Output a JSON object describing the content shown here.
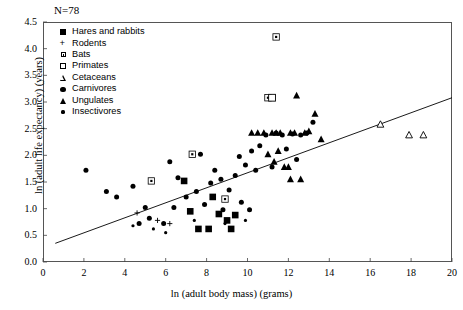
{
  "annotation": {
    "sample_size": "N=78"
  },
  "axes": {
    "xlabel": "ln (adult body mass) (grams)",
    "ylabel": "ln (adult life expectancy) (years)",
    "xticks": [
      "0",
      "2",
      "4",
      "6",
      "8",
      "10",
      "12",
      "14",
      "16",
      "18",
      "20"
    ],
    "yticks": [
      "0.0",
      "0.5",
      "1.0",
      "1.5",
      "2.0",
      "2.5",
      "3.0",
      "3.5",
      "4.0",
      "4.5"
    ]
  },
  "legend": {
    "entries": [
      {
        "label": "Hares and rabbits",
        "marker": "square-filled"
      },
      {
        "label": "Rodents",
        "marker": "plus"
      },
      {
        "label": "Bats",
        "marker": "square-dotted"
      },
      {
        "label": "Primates",
        "marker": "square-open"
      },
      {
        "label": "Cetaceans",
        "marker": "triangle-open"
      },
      {
        "label": "Carnivores",
        "marker": "circle-filled"
      },
      {
        "label": "Ungulates",
        "marker": "triangle-filled"
      },
      {
        "label": "Insectivores",
        "marker": "dot-small"
      }
    ]
  },
  "chart_data": {
    "type": "scatter",
    "title": "",
    "xlabel": "ln (adult body mass) (grams)",
    "ylabel": "ln (adult life expectancy) (years)",
    "xlim": [
      0,
      20
    ],
    "ylim": [
      0.0,
      4.5
    ],
    "xticks": [
      0,
      2,
      4,
      6,
      8,
      10,
      12,
      14,
      16,
      18,
      20
    ],
    "yticks": [
      0.0,
      0.5,
      1.0,
      1.5,
      2.0,
      2.5,
      3.0,
      3.5,
      4.0,
      4.5
    ],
    "grid": false,
    "legend_position": "upper-left-inside",
    "sample_size": 78,
    "regression_line": {
      "x0": 0.6,
      "y0": 0.35,
      "x1": 20.0,
      "y1": 3.08
    },
    "series": [
      {
        "name": "Hares and rabbits",
        "marker": "square-filled",
        "points": [
          [
            7.2,
            0.95
          ],
          [
            7.6,
            0.62
          ],
          [
            8.1,
            0.62
          ],
          [
            8.6,
            0.9
          ],
          [
            9.0,
            0.78
          ],
          [
            9.2,
            0.62
          ],
          [
            9.4,
            0.88
          ],
          [
            6.9,
            1.52
          ],
          [
            8.3,
            1.22
          ]
        ]
      },
      {
        "name": "Rodents",
        "marker": "plus",
        "points": [
          [
            4.6,
            0.92
          ],
          [
            5.6,
            0.78
          ],
          [
            6.2,
            0.72
          ]
        ]
      },
      {
        "name": "Bats",
        "marker": "square-dotted",
        "points": [
          [
            11.4,
            4.22
          ],
          [
            11.0,
            3.08
          ],
          [
            7.3,
            2.02
          ],
          [
            5.3,
            1.52
          ],
          [
            8.9,
            1.18
          ]
        ]
      },
      {
        "name": "Primates",
        "marker": "square-open",
        "points": [
          [
            11.2,
            3.08
          ]
        ]
      },
      {
        "name": "Cetaceans",
        "marker": "triangle-open",
        "points": [
          [
            16.5,
            2.58
          ],
          [
            17.9,
            2.38
          ],
          [
            18.6,
            2.38
          ]
        ]
      },
      {
        "name": "Carnivores",
        "marker": "circle-filled",
        "points": [
          [
            2.1,
            1.72
          ],
          [
            3.1,
            1.32
          ],
          [
            3.6,
            1.22
          ],
          [
            4.4,
            1.42
          ],
          [
            4.7,
            0.72
          ],
          [
            5.2,
            0.82
          ],
          [
            5.9,
            0.72
          ],
          [
            6.4,
            1.02
          ],
          [
            6.6,
            1.58
          ],
          [
            7.0,
            1.22
          ],
          [
            7.5,
            1.32
          ],
          [
            7.9,
            1.08
          ],
          [
            8.2,
            1.48
          ],
          [
            8.4,
            1.72
          ],
          [
            8.7,
            1.55
          ],
          [
            9.1,
            1.35
          ],
          [
            9.4,
            1.62
          ],
          [
            9.6,
            1.98
          ],
          [
            9.9,
            1.82
          ],
          [
            10.2,
            2.08
          ],
          [
            10.4,
            1.72
          ],
          [
            10.6,
            2.18
          ],
          [
            10.9,
            2.38
          ],
          [
            11.2,
            1.78
          ],
          [
            11.4,
            2.42
          ],
          [
            11.7,
            2.38
          ],
          [
            11.9,
            2.12
          ],
          [
            12.2,
            2.4
          ],
          [
            12.4,
            1.92
          ],
          [
            12.6,
            2.38
          ],
          [
            12.9,
            2.42
          ],
          [
            13.2,
            2.62
          ],
          [
            6.2,
            1.88
          ],
          [
            7.7,
            2.02
          ],
          [
            9.7,
            1.12
          ],
          [
            10.1,
            0.98
          ],
          [
            8.8,
            0.98
          ],
          [
            5.0,
            1.02
          ]
        ]
      },
      {
        "name": "Ungulates",
        "marker": "triangle-filled",
        "points": [
          [
            10.2,
            2.42
          ],
          [
            10.5,
            2.42
          ],
          [
            10.8,
            2.42
          ],
          [
            11.2,
            2.42
          ],
          [
            11.4,
            2.42
          ],
          [
            11.6,
            2.42
          ],
          [
            12.1,
            2.42
          ],
          [
            12.3,
            2.42
          ],
          [
            12.8,
            2.42
          ],
          [
            13.0,
            2.45
          ],
          [
            13.3,
            2.78
          ],
          [
            12.4,
            3.12
          ],
          [
            11.0,
            2.02
          ],
          [
            11.5,
            2.08
          ],
          [
            11.8,
            1.78
          ],
          [
            12.0,
            1.78
          ],
          [
            12.6,
            1.55
          ],
          [
            12.1,
            1.55
          ],
          [
            13.6,
            2.3
          ],
          [
            11.3,
            1.88
          ]
        ]
      },
      {
        "name": "Insectivores",
        "marker": "dot-small",
        "points": [
          [
            4.4,
            0.68
          ],
          [
            5.4,
            0.62
          ],
          [
            6.0,
            0.55
          ],
          [
            8.9,
            0.72
          ],
          [
            9.9,
            0.78
          ],
          [
            7.4,
            0.78
          ]
        ]
      }
    ]
  }
}
